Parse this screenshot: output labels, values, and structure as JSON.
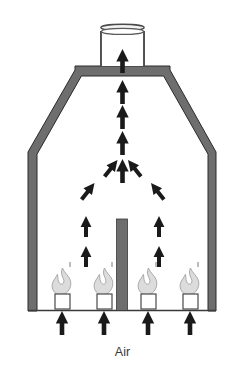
{
  "figure": {
    "type": "technical-diagram",
    "background_color": "#ffffff",
    "labels": [
      {
        "id": "air",
        "text": "Air"
      }
    ],
    "colors": {
      "wall_fill": "#6e6e6e",
      "wall_outline": "#2b2b2b",
      "arrow_fill": "#1a1a1a",
      "baffle_fill": "#6e6e6e",
      "flame_fill": "#d8d8d8",
      "flame_outline": "#9a9a9a",
      "burner_fill": "#ffffff",
      "burner_outline": "#4a4a4a",
      "base_line": "#3a3a3a",
      "chimney_outline": "#4a4a4a",
      "label_color": "#3a3a3a"
    },
    "components": {
      "chimney": {
        "name": "chimney-stack",
        "rim_label": "open-top-rim"
      },
      "neck": {
        "name": "furnace-neck"
      },
      "shoulder": {
        "name": "furnace-shoulder"
      },
      "chamber": {
        "name": "combustion-chamber"
      },
      "baffle": {
        "name": "center-baffle"
      },
      "base": {
        "name": "furnace-floor"
      }
    },
    "burners": [
      {
        "id": "burner-1",
        "x": 62,
        "flame": "flame-1"
      },
      {
        "id": "burner-2",
        "x": 104,
        "flame": "flame-2"
      },
      {
        "id": "burner-3",
        "x": 148,
        "flame": "flame-3"
      },
      {
        "id": "burner-4",
        "x": 190,
        "flame": "flame-4"
      }
    ],
    "air_inlet_arrows": [
      {
        "id": "air-arrow-1",
        "x": 62
      },
      {
        "id": "air-arrow-2",
        "x": 104
      },
      {
        "id": "air-arrow-3",
        "x": 148
      },
      {
        "id": "air-arrow-4",
        "x": 190
      }
    ],
    "flow_arrows": {
      "vertical_stack_count": 5,
      "converging_count": 4,
      "side_rising_count": 4,
      "description": "combustion gas flow rising and converging into the chimney"
    }
  }
}
